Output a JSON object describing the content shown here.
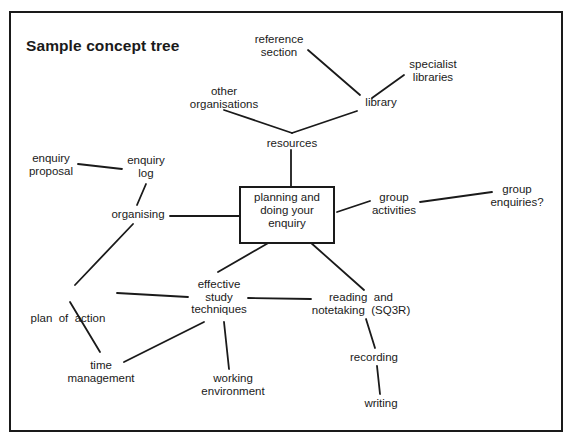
{
  "title": "Sample concept tree",
  "central_node": {
    "lines": [
      "planning and",
      "doing your",
      "enquiry"
    ]
  },
  "nodes": {
    "reference_section": {
      "lines": [
        "reference",
        "section"
      ]
    },
    "specialist_libraries": {
      "lines": [
        "specialist",
        "libraries"
      ]
    },
    "library": {
      "lines": [
        "library"
      ]
    },
    "other_organisations": {
      "lines": [
        "other",
        "organisations"
      ]
    },
    "resources": {
      "lines": [
        "resources"
      ]
    },
    "enquiry_proposal": {
      "lines": [
        "enquiry",
        "proposal"
      ]
    },
    "enquiry_log": {
      "lines": [
        "enquiry",
        "log"
      ]
    },
    "organising": {
      "lines": [
        "organising"
      ]
    },
    "group_activities": {
      "lines": [
        "group",
        "activities"
      ]
    },
    "group_enquiries": {
      "lines": [
        "group",
        "enquiries?"
      ]
    },
    "plan_of_action": {
      "lines": [
        "plan  of  action"
      ]
    },
    "effective_study_techniques": {
      "lines": [
        "effective",
        "study",
        "techniques"
      ]
    },
    "reading_and_notetaking": {
      "lines": [
        "reading  and",
        "notetaking  (SQ3R)"
      ]
    },
    "time_management": {
      "lines": [
        "time",
        "management"
      ]
    },
    "working_environment": {
      "lines": [
        "working",
        "environment"
      ]
    },
    "recording": {
      "lines": [
        "recording"
      ]
    },
    "writing": {
      "lines": [
        "writing"
      ]
    }
  },
  "edges": [
    [
      "reference_section",
      "library"
    ],
    [
      "specialist_libraries",
      "library"
    ],
    [
      "library",
      "resources"
    ],
    [
      "other_organisations",
      "resources"
    ],
    [
      "resources",
      "central_node"
    ],
    [
      "enquiry_proposal",
      "enquiry_log"
    ],
    [
      "enquiry_log",
      "organising"
    ],
    [
      "organising",
      "central_node"
    ],
    [
      "central_node",
      "group_activities"
    ],
    [
      "group_activities",
      "group_enquiries"
    ],
    [
      "organising",
      "plan_of_action"
    ],
    [
      "central_node",
      "effective_study_techniques"
    ],
    [
      "central_node",
      "reading_and_notetaking"
    ],
    [
      "plan_of_action",
      "effective_study_techniques"
    ],
    [
      "effective_study_techniques",
      "reading_and_notetaking"
    ],
    [
      "plan_of_action",
      "time_management"
    ],
    [
      "effective_study_techniques",
      "time_management"
    ],
    [
      "effective_study_techniques",
      "working_environment"
    ],
    [
      "reading_and_notetaking",
      "recording"
    ],
    [
      "recording",
      "writing"
    ]
  ],
  "colors": {
    "ink": "#1a1a1a",
    "background": "#ffffff"
  }
}
